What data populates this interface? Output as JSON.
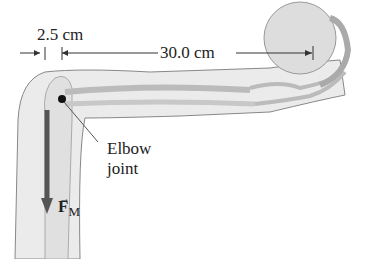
{
  "diagram": {
    "dimension_short": "2.5 cm",
    "dimension_long": "30.0 cm",
    "elbow_label_line1": "Elbow",
    "elbow_label_line2": "joint",
    "force_symbol": "F",
    "force_subscript": "M",
    "colors": {
      "arm_fill": "#e9e9e9",
      "outline": "#777777",
      "bone": "#dcdcdc",
      "ball": "#dddddd",
      "force_arrow": "#555555",
      "pivot": "#111111"
    }
  }
}
